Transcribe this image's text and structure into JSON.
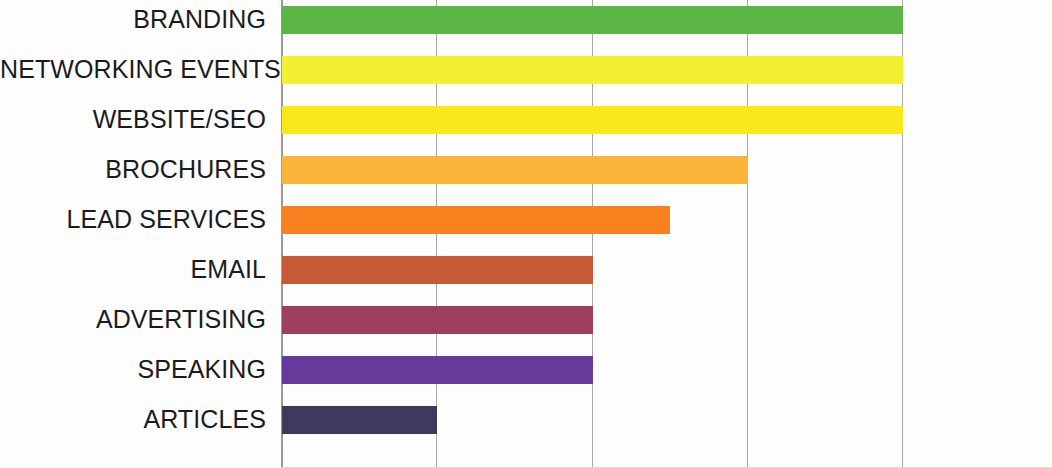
{
  "chart_data": {
    "type": "bar",
    "orientation": "horizontal",
    "title": "",
    "subtitle": "",
    "xlabel": "",
    "ylabel": "",
    "categories": [
      "BRANDING",
      "NETWORKING EVENTS",
      "WEBSITE/SEO",
      "BROCHURES",
      "LEAD SERVICES",
      "EMAIL",
      "ADVERTISING",
      "SPEAKING",
      "ARTICLES"
    ],
    "values": [
      100,
      100,
      100,
      75,
      62.5,
      50,
      50,
      50,
      25
    ],
    "colors": [
      "#5cb646",
      "#f5ef34",
      "#fbe81c",
      "#f9b53a",
      "#f8801e",
      "#c55a35",
      "#9d3f5f",
      "#653a9b",
      "#3d3a5e"
    ],
    "xlim": [
      0,
      100
    ],
    "xticks": [
      0,
      25,
      50,
      75,
      100
    ],
    "xtick_labels": [
      "",
      "",
      "",
      "",
      ""
    ],
    "ytick_labels_visible": true,
    "grid": "vertical",
    "gridline_color": "#a9a9a9",
    "legend": null,
    "background": "#ffffff",
    "bars": [
      {
        "label": "BRANDING",
        "value": 100,
        "color": "#5cb646"
      },
      {
        "label": "NETWORKING EVENTS",
        "value": 100,
        "color": "#f5ef34"
      },
      {
        "label": "WEBSITE/SEO",
        "value": 100,
        "color": "#fbe81c"
      },
      {
        "label": "BROCHURES",
        "value": 75,
        "color": "#f9b53a"
      },
      {
        "label": "LEAD SERVICES",
        "value": 62.5,
        "color": "#f8801e"
      },
      {
        "label": "EMAIL",
        "value": 50,
        "color": "#c55a35"
      },
      {
        "label": "ADVERTISING",
        "value": 50,
        "color": "#9d3f5f"
      },
      {
        "label": "SPEAKING",
        "value": 50,
        "color": "#653a9b"
      },
      {
        "label": "ARTICLES",
        "value": 25,
        "color": "#3d3a5e"
      }
    ]
  }
}
